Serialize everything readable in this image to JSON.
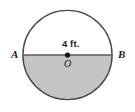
{
  "figure": {
    "kind": "geometry-diagram",
    "shape": "circle-with-shaded-semicircle",
    "width": 135,
    "height": 112,
    "background_color": "#ffffff",
    "circle": {
      "center_x": 67.5,
      "center_y": 55,
      "radius": 45,
      "stroke_color": "#4a4a4a",
      "stroke_width": 1.4,
      "fill_color": "#ffffff"
    },
    "shaded_region": {
      "name": "lower-semicircle",
      "fill_color": "#c4c4c4",
      "description": "bottom half of the circle below diameter AB"
    },
    "diameter": {
      "name": "segment-AB",
      "stroke_color": "#5a5a5a",
      "stroke_width": 1.6,
      "x1": 22.5,
      "y1": 55,
      "x2": 112.5,
      "y2": 55
    },
    "center_point": {
      "name": "point-O",
      "fill_color": "#111111",
      "radius": 2.6
    },
    "labels": {
      "endpoint_left": "A",
      "endpoint_right": "B",
      "center": "O",
      "measure": "4 ft."
    }
  }
}
